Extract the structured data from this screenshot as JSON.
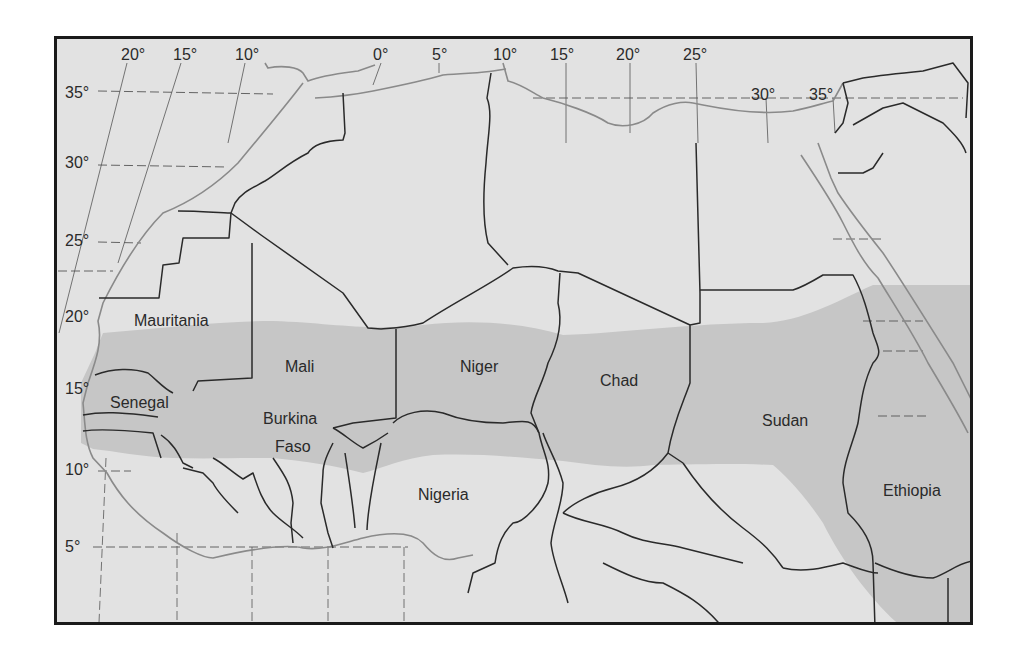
{
  "map": {
    "colors": {
      "background": "#e2e2e2",
      "sahel_band": "#c6c6c6",
      "border": "#2a2a2a",
      "coastline": "#8a8a8a",
      "graticule": "#555555",
      "frame": "#1a1a1a"
    },
    "longitude_labels": [
      {
        "text": "20°",
        "x": 118,
        "y": 44
      },
      {
        "text": "15°",
        "x": 170,
        "y": 44
      },
      {
        "text": "10°",
        "x": 232,
        "y": 44
      },
      {
        "text": "0°",
        "x": 370,
        "y": 44
      },
      {
        "text": "5°",
        "x": 429,
        "y": 44
      },
      {
        "text": "10°",
        "x": 490,
        "y": 44
      },
      {
        "text": "15°",
        "x": 547,
        "y": 44
      },
      {
        "text": "20°",
        "x": 613,
        "y": 44
      },
      {
        "text": "25°",
        "x": 680,
        "y": 44
      },
      {
        "text": "30°",
        "x": 748,
        "y": 84
      },
      {
        "text": "35°",
        "x": 806,
        "y": 84
      }
    ],
    "latitude_labels": [
      {
        "text": "35°",
        "x": 62,
        "y": 82
      },
      {
        "text": "30°",
        "x": 62,
        "y": 152
      },
      {
        "text": "25°",
        "x": 62,
        "y": 230
      },
      {
        "text": "20°",
        "x": 62,
        "y": 306
      },
      {
        "text": "15°",
        "x": 62,
        "y": 378
      },
      {
        "text": "10°",
        "x": 62,
        "y": 459
      },
      {
        "text": "5°",
        "x": 62,
        "y": 536
      }
    ],
    "country_labels": [
      {
        "text": "Mauritania",
        "x": 131,
        "y": 310
      },
      {
        "text": "Mali",
        "x": 282,
        "y": 356
      },
      {
        "text": "Niger",
        "x": 457,
        "y": 356
      },
      {
        "text": "Chad",
        "x": 597,
        "y": 370
      },
      {
        "text": "Sudan",
        "x": 759,
        "y": 410
      },
      {
        "text": "Senegal",
        "x": 107,
        "y": 392
      },
      {
        "text": "Burkina",
        "x": 260,
        "y": 408
      },
      {
        "text": "Faso",
        "x": 272,
        "y": 436
      },
      {
        "text": "Nigeria",
        "x": 415,
        "y": 484
      },
      {
        "text": "Ethiopia",
        "x": 880,
        "y": 480
      }
    ],
    "shaded_region": "Sahel"
  }
}
